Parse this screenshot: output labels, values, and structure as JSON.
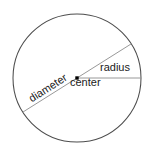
{
  "figure": {
    "background_color": "#ffffff"
  },
  "labels": {
    "radius": "radius",
    "center": "center",
    "diameter": "diameter"
  },
  "colors": {
    "circle_stroke": "#4d4d4d",
    "radius_line": "#8c8c8c",
    "diameter_line": "#8c8c8c",
    "center_dot": "#000000",
    "text": "#1b1b1b"
  },
  "geometry": {
    "circle": {
      "cx": 77,
      "cy": 78,
      "r": 64,
      "stroke_width": 1
    },
    "center_point": {
      "x": 77,
      "y": 78,
      "size": 3.4
    },
    "radius_segment": {
      "x1": 77,
      "y1": 78,
      "x2": 141,
      "y2": 78
    },
    "diameter_segment": {
      "x1": 23,
      "y1": 112,
      "x2": 131,
      "y2": 44,
      "angle_deg": -32.5
    }
  }
}
